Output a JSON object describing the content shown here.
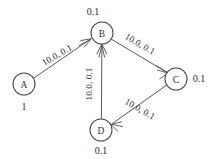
{
  "diagram": {
    "background_color": "#ffffff",
    "stroke_color": "#5a5a5a",
    "text_color": "#2e2e2e",
    "nodes": [
      {
        "id": "A",
        "label": "A",
        "weight": "1",
        "cx": 24,
        "cy": 84,
        "r": 11,
        "weight_x": 24,
        "weight_y": 106,
        "weight_anchor": "below"
      },
      {
        "id": "B",
        "label": "B",
        "weight": "0.1",
        "cx": 102,
        "cy": 33,
        "r": 11,
        "weight_x": 93,
        "weight_y": 11,
        "weight_anchor": "above"
      },
      {
        "id": "C",
        "label": "C",
        "weight": "0.1",
        "cx": 176,
        "cy": 79,
        "r": 11,
        "weight_x": 199,
        "weight_y": 78,
        "weight_anchor": "right"
      },
      {
        "id": "D",
        "label": "D",
        "weight": "0.1",
        "cx": 101,
        "cy": 130,
        "r": 11,
        "weight_x": 101,
        "weight_y": 150,
        "weight_anchor": "below"
      }
    ],
    "edges": [
      {
        "id": "A-B",
        "from": "A",
        "to": "B",
        "label": "10.0, 0.1",
        "label_x": 57,
        "label_y": 55,
        "label_rotation": -30,
        "directed": true
      },
      {
        "id": "B-C",
        "from": "B",
        "to": "C",
        "label": "10.0, 0.1",
        "label_x": 140,
        "label_y": 44,
        "label_rotation": 30,
        "directed": true
      },
      {
        "id": "C-D",
        "from": "C",
        "to": "D",
        "label": "10.0, 0.1",
        "label_x": 140,
        "label_y": 109,
        "label_rotation": 30,
        "directed": true
      },
      {
        "id": "D-B",
        "from": "D",
        "to": "B",
        "label": "10.0, 0.1",
        "label_x": 89,
        "label_y": 84,
        "label_rotation": -90,
        "directed": true
      }
    ]
  }
}
